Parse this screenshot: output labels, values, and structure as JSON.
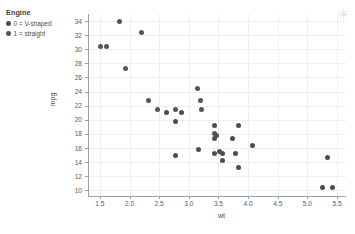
{
  "legend": {
    "title": "Engine",
    "items": [
      {
        "label": "0 = V-shaped",
        "color": "#4d4d4d"
      },
      {
        "label": "1 = straight",
        "color": "#555555"
      }
    ]
  },
  "toolbar": {
    "settings_icon": "gear-icon"
  },
  "axes": {
    "x_label": "wt",
    "y_label": "mpg",
    "x_ticks": [
      "1.5",
      "2.0",
      "2.5",
      "3.0",
      "3.5",
      "4.0",
      "4.5",
      "5.0",
      "5.5"
    ],
    "y_ticks": [
      "10",
      "12",
      "14",
      "16",
      "18",
      "20",
      "22",
      "24",
      "26",
      "28",
      "30",
      "32",
      "34"
    ]
  },
  "chart_data": {
    "type": "scatter",
    "title": "",
    "xlabel": "wt",
    "ylabel": "mpg",
    "xlim": [
      1.3,
      5.65
    ],
    "ylim": [
      9.2,
      35.0
    ],
    "grid": true,
    "legend_position": "top-left-outside",
    "legend_title": "Engine",
    "series": [
      {
        "name": "0 = V-shaped",
        "color": "#4d4d4d",
        "points": [
          {
            "x": 2.62,
            "y": 21.0
          },
          {
            "x": 2.875,
            "y": 21.0
          },
          {
            "x": 3.44,
            "y": 19.2
          },
          {
            "x": 3.46,
            "y": 17.8
          },
          {
            "x": 3.57,
            "y": 14.3
          },
          {
            "x": 3.44,
            "y": 17.3
          },
          {
            "x": 3.57,
            "y": 15.2
          },
          {
            "x": 4.07,
            "y": 16.4
          },
          {
            "x": 3.73,
            "y": 17.3
          },
          {
            "x": 3.78,
            "y": 15.2
          },
          {
            "x": 5.25,
            "y": 10.4
          },
          {
            "x": 5.424,
            "y": 10.4
          },
          {
            "x": 5.345,
            "y": 14.7
          },
          {
            "x": 3.52,
            "y": 15.5
          },
          {
            "x": 3.435,
            "y": 15.2
          },
          {
            "x": 3.84,
            "y": 13.3
          },
          {
            "x": 3.845,
            "y": 19.2
          },
          {
            "x": 2.77,
            "y": 19.7
          },
          {
            "x": 3.17,
            "y": 15.8
          },
          {
            "x": 2.77,
            "y": 15.0
          }
        ]
      },
      {
        "name": "1 = straight",
        "color": "#555555",
        "points": [
          {
            "x": 3.19,
            "y": 22.8
          },
          {
            "x": 3.215,
            "y": 21.4
          },
          {
            "x": 3.15,
            "y": 24.4
          },
          {
            "x": 3.44,
            "y": 18.1
          },
          {
            "x": 2.2,
            "y": 32.4
          },
          {
            "x": 1.615,
            "y": 30.4
          },
          {
            "x": 1.835,
            "y": 33.9
          },
          {
            "x": 2.465,
            "y": 21.5
          },
          {
            "x": 1.935,
            "y": 27.3
          },
          {
            "x": 1.513,
            "y": 30.4
          },
          {
            "x": 2.78,
            "y": 21.4
          },
          {
            "x": 2.32,
            "y": 22.8
          }
        ]
      }
    ]
  }
}
